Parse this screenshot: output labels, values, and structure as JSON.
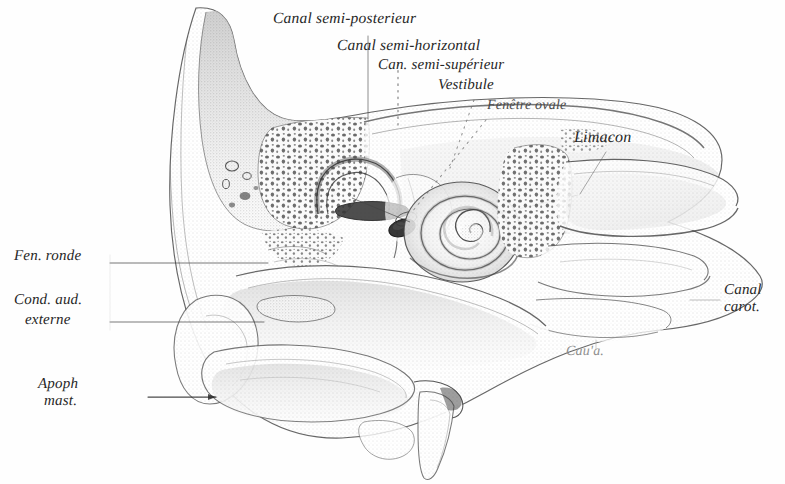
{
  "figure": {
    "kind": "anatomical-engraving",
    "background_color": "#fefefe",
    "ink_color": "#262626",
    "width": 785,
    "height": 484
  },
  "labels": [
    {
      "id": "canal-semi-posterieur",
      "text": "Canal semi-posterieur",
      "x": 273,
      "y": 18,
      "size": 15.5,
      "tone": "dark"
    },
    {
      "id": "canal-semi-horizontal",
      "text": "Canal semi-horizontal",
      "x": 337,
      "y": 45,
      "size": 15.5,
      "tone": "dark"
    },
    {
      "id": "can-semi-superieur",
      "text": "Can. semi-supérieur",
      "x": 378,
      "y": 65,
      "size": 15,
      "tone": "dark"
    },
    {
      "id": "vestibule",
      "text": "Vestibule",
      "x": 438,
      "y": 85,
      "size": 15,
      "tone": "dark"
    },
    {
      "id": "fenetre-ovale",
      "text": "Fenêtre ovale",
      "x": 487,
      "y": 106,
      "size": 14,
      "tone": "mid"
    },
    {
      "id": "limacon",
      "text": "Limacon",
      "x": 574,
      "y": 138,
      "size": 16,
      "tone": "dark"
    },
    {
      "id": "fen-ronde",
      "text": "Fen. ronde",
      "x": 14,
      "y": 256,
      "size": 15,
      "tone": "dark"
    },
    {
      "id": "cond-aud-externe-1",
      "text": "Cond. aud.",
      "x": 14,
      "y": 300,
      "size": 15,
      "tone": "dark"
    },
    {
      "id": "cond-aud-externe-2",
      "text": "externe",
      "x": 25,
      "y": 320,
      "size": 15,
      "tone": "dark"
    },
    {
      "id": "apoph-mast-1",
      "text": "Apoph",
      "x": 38,
      "y": 384,
      "size": 15,
      "tone": "dark"
    },
    {
      "id": "apoph-mast-2",
      "text": "mast.",
      "x": 44,
      "y": 401,
      "size": 15,
      "tone": "dark"
    },
    {
      "id": "canal-carot-1",
      "text": "Canal",
      "x": 724,
      "y": 290,
      "size": 15,
      "tone": "dark"
    },
    {
      "id": "canal-carot-2",
      "text": "carot.",
      "x": 724,
      "y": 307,
      "size": 15,
      "tone": "dark"
    },
    {
      "id": "cau-a",
      "text": "Cau'a.",
      "x": 566,
      "y": 352,
      "size": 14,
      "tone": "faint"
    }
  ],
  "leaders": [
    {
      "id": "leader-canal-semi-posterieur",
      "style": "solid",
      "points": "368,36 368,120"
    },
    {
      "id": "leader-canal-semi-horizontal",
      "style": "dotted",
      "points": "398,63 398,124"
    },
    {
      "id": "leader-can-semi-superieur",
      "style": "dotted",
      "points": "400,84 398,118"
    },
    {
      "id": "leader-vestibule",
      "style": "dotted",
      "points": "472,104 452,170"
    },
    {
      "id": "leader-fenetre-ovale",
      "style": "dotted",
      "points": "484,124 404,216"
    },
    {
      "id": "leader-limacon",
      "style": "solid",
      "points": "604,150 520,205"
    },
    {
      "id": "leader-fen-ronde",
      "style": "solid",
      "points": "110,263 268,263"
    },
    {
      "id": "leader-cond-aud-externe",
      "style": "solid",
      "points": "110,322 262,322"
    },
    {
      "id": "leader-apoph-mast",
      "style": "solid",
      "points": "148,397 215,397"
    },
    {
      "id": "leader-canal-carot",
      "style": "solid",
      "points": "718,300 690,300"
    },
    {
      "id": "leader-cau-a",
      "style": "solid",
      "points": "596,350 596,340"
    },
    {
      "id": "leader-cochlea-axis",
      "style": "solid",
      "points": "497,214 575,196"
    }
  ],
  "structures": [
    {
      "id": "petrous-bone-outline",
      "name": "Os temporal — contour"
    },
    {
      "id": "squamous-part",
      "name": "Écaille du temporal"
    },
    {
      "id": "mastoid-cells",
      "name": "Cellules mastoïdiennes"
    },
    {
      "id": "semicircular-canals",
      "name": "Canaux semi-circulaires"
    },
    {
      "id": "vestibule-cavity",
      "name": "Vestibule"
    },
    {
      "id": "oval-window",
      "name": "Fenêtre ovale"
    },
    {
      "id": "cochlea-spiral",
      "name": "Limaçon (cochlée)"
    },
    {
      "id": "carotid-canal",
      "name": "Canal carotidien"
    },
    {
      "id": "styloid-process",
      "name": "Apophyse styloïde"
    },
    {
      "id": "mastoid-process",
      "name": "Apophyse mastoïde"
    },
    {
      "id": "external-auditory-canal",
      "name": "Conduit auditif externe"
    }
  ]
}
